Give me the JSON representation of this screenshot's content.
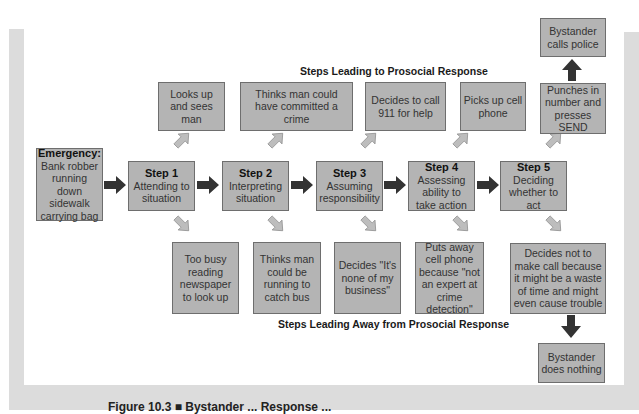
{
  "figure": {
    "top_label": "Steps Leading to Prosocial Response",
    "bottom_label": "Steps Leading Away from Prosocial Response",
    "caption": "Figure 10.3 ■ Bystander ... Response ...",
    "colors": {
      "box_fill": "#b4b4b4",
      "box_border": "#6e6e6e",
      "main_arrow": "#333333",
      "side_arrow": "#bdbdbd",
      "frame": "#dcdcdc"
    }
  },
  "emergency": {
    "title": "Emergency:",
    "text": "Bank robber running down sidewalk carrying bag"
  },
  "steps": [
    {
      "title": "Step 1",
      "text": "Attending to situation"
    },
    {
      "title": "Step 2",
      "text": "Interpreting situation"
    },
    {
      "title": "Step 3",
      "text": "Assuming responsibility"
    },
    {
      "title": "Step 4",
      "text": "Assessing ability to take action"
    },
    {
      "title": "Step 5",
      "text": "Deciding whether to act"
    }
  ],
  "prosocial": [
    "Looks up and sees man",
    "Thinks man could have committed a crime",
    "Decides to call 911 for help",
    "Picks up cell phone",
    "Punches in number and presses SEND"
  ],
  "prosocial_outcome": "Bystander calls police",
  "antisocial": [
    "Too busy reading newspaper to look up",
    "Thinks man could be running to catch bus",
    "Decides \"It's none of my business\"",
    "Puts away cell phone because \"not an expert at crime detection\"",
    "Decides not to make call because it might be a waste of time and might even cause trouble"
  ],
  "antisocial_outcome": "Bystander does nothing"
}
